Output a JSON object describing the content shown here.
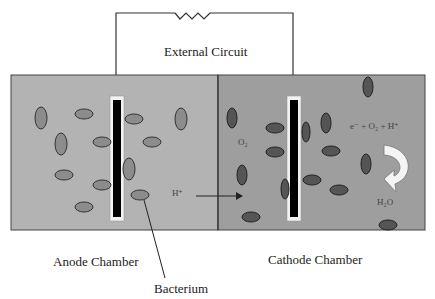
{
  "diagram": {
    "labels": {
      "external_circuit": "External Circuit",
      "anode_chamber": "Anode Chamber",
      "cathode_chamber": "Cathode Chamber",
      "bacterium": "Bacterium",
      "proton": "H⁺",
      "oxygen": "O₂",
      "reaction": "e⁻ + O₂ + H⁺",
      "water": "H₂O"
    },
    "colors": {
      "anode_bg": "#b3b3b3",
      "cathode_bg": "#9e9e9e",
      "anode_bacteria": "#8c8c8c",
      "cathode_bacteria": "#555555",
      "electrode": "#000000",
      "electrode_frame": "#f2f2f2",
      "wire": "#333333"
    },
    "components": [
      {
        "id": "resistor",
        "type": "load"
      },
      {
        "id": "anode",
        "type": "electrode"
      },
      {
        "id": "cathode",
        "type": "electrode"
      },
      {
        "id": "membrane",
        "type": "separator"
      }
    ]
  }
}
